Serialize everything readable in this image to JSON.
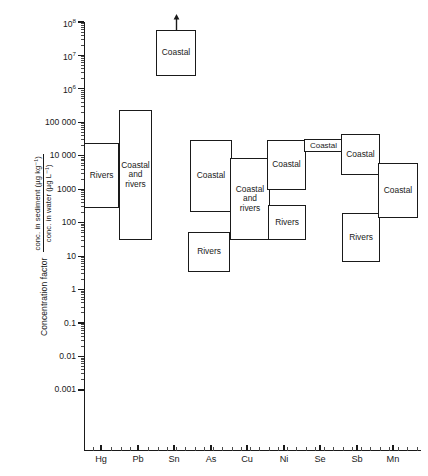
{
  "chart_data": {
    "type": "bar",
    "title": "",
    "xlabel": "",
    "ylabel_main": "Concentration factor",
    "ylabel_numerator": "conc. in sediment (µg kg⁻¹)",
    "ylabel_denominator": "conc. in water (µg L⁻¹)",
    "yscale": "log",
    "ylim": [
      0.001,
      100000000
    ],
    "grid": false,
    "legend": "none",
    "categories": [
      "Hg",
      "Pb",
      "Sn",
      "As",
      "Cu",
      "Ni",
      "Se",
      "Sb",
      "Mn"
    ],
    "ytick_labels": [
      "10⁸",
      "10⁷",
      "10⁶",
      "100 000",
      "10 000",
      "1000",
      "100",
      "10",
      "1",
      "0.1",
      "0.01",
      "0.001"
    ],
    "ytick_values": [
      100000000.0,
      10000000.0,
      1000000.0,
      100000.0,
      10000.0,
      1000.0,
      100,
      10,
      1,
      0.1,
      0.01,
      0.001
    ],
    "boxes": [
      {
        "element": "Hg",
        "label": "Rivers",
        "low": 2500,
        "high": 100000,
        "arrow_up": false
      },
      {
        "element": "Pb",
        "label": "Coastal\nand\nrivers",
        "low": 250,
        "high": 900000,
        "arrow_up": false
      },
      {
        "element": "Sn",
        "label": "Coastal",
        "low": 4000000,
        "high": 100000000,
        "arrow_up": true
      },
      {
        "element": "As",
        "label": "Coastal",
        "low": 1600,
        "high": 140000,
        "arrow_up": false
      },
      {
        "element": "As",
        "label": "Rivers",
        "low": 120,
        "high": 700,
        "arrow_up": false
      },
      {
        "element": "Cu",
        "label": "Coastal\nand\nrivers",
        "low": 600,
        "high": 30000,
        "arrow_up": false
      },
      {
        "element": "Ni",
        "label": "Coastal",
        "low": 8000,
        "high": 130000,
        "arrow_up": false
      },
      {
        "element": "Ni",
        "label": "Rivers",
        "low": 600,
        "high": 3000,
        "arrow_up": false
      },
      {
        "element": "Se",
        "label": "Coastal",
        "low": 90000,
        "high": 160000,
        "arrow_up": false
      },
      {
        "element": "Sb",
        "label": "Coastal",
        "low": 20000,
        "high": 200000,
        "arrow_up": false
      },
      {
        "element": "Sb",
        "label": "Rivers",
        "low": 110,
        "high": 1500,
        "arrow_up": false
      },
      {
        "element": "Mn",
        "label": "Coastal",
        "low": 1100,
        "high": 30000,
        "arrow_up": false
      }
    ]
  },
  "geometry": {
    "plot_left": 84,
    "plot_right": 421,
    "plot_top": 22,
    "plot_bottom": 450,
    "decade_px": 33.45,
    "y_top_value": 100000000,
    "column_centers": [
      101,
      138,
      174,
      211,
      247,
      284,
      320,
      357,
      393
    ],
    "box_rects": [
      {
        "x": 84,
        "w": 35,
        "top": 143,
        "bottom": 207.5,
        "label": "Rivers"
      },
      {
        "x": 119,
        "w": 33,
        "top": 110,
        "bottom": 240,
        "label": "Coastal\nand\nrivers"
      },
      {
        "x": 156,
        "w": 40,
        "top": 30,
        "bottom": 76,
        "label": "Coastal",
        "arrow": true
      },
      {
        "x": 190,
        "w": 42,
        "top": 140,
        "bottom": 212,
        "label": "Coastal"
      },
      {
        "x": 188,
        "w": 42,
        "top": 232,
        "bottom": 272,
        "label": "Rivers"
      },
      {
        "x": 230,
        "w": 40,
        "top": 158,
        "bottom": 240,
        "label": "Coastal\nand\nrivers"
      },
      {
        "x": 267,
        "w": 39,
        "top": 140,
        "bottom": 190,
        "label": "Coastal"
      },
      {
        "x": 268,
        "w": 38,
        "top": 205,
        "bottom": 240,
        "label": "Rivers"
      },
      {
        "x": 304,
        "w": 39,
        "top": 139,
        "bottom": 152,
        "label": "Coastal"
      },
      {
        "x": 341,
        "w": 39,
        "top": 134,
        "bottom": 175,
        "label": "Coastal"
      },
      {
        "x": 342,
        "w": 38,
        "top": 213,
        "bottom": 262,
        "label": "Rivers"
      },
      {
        "x": 378,
        "w": 40,
        "top": 163,
        "bottom": 218,
        "label": "Coastal"
      }
    ]
  }
}
